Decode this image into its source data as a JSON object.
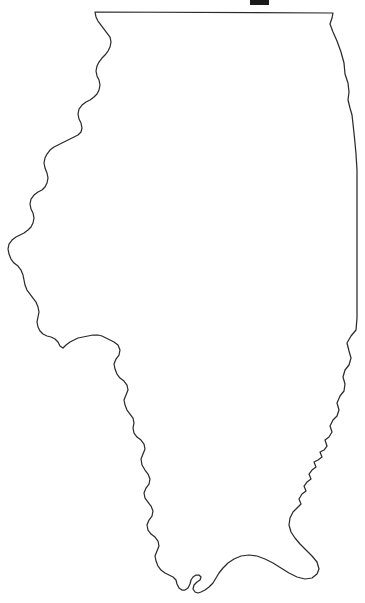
{
  "document": {
    "kind": "outline-map",
    "subject": "Illinois",
    "background_color": "#ffffff",
    "outline_color": "#2b2b2b",
    "fill_color": "#ffffff",
    "stroke_width": 1.25,
    "width": 365,
    "height": 603,
    "text_labels": [],
    "legend": null,
    "title_text": ""
  },
  "artifacts": {
    "top_scan_mark": {
      "name": "scan-artifact",
      "color": "#1a1a1a",
      "x": 250,
      "y": 0,
      "width": 19,
      "height": 5
    }
  },
  "geometry": {
    "viewbox": "0 0 365 603",
    "state_outline_path": "M 95 12 L 333 13 L 332 18 L 330 24 L 333 32 L 337 41 L 341 52 L 344 63 L 345 74 L 348 83 L 349 92 L 348 100 L 350 108 L 352 115 L 353 124 L 354 133 L 355 143 L 356 154 L 357 170 L 357 200 L 357 240 L 357 280 L 357 318 L 356 330 L 351 336 L 347 343 L 349 351 L 351 358 L 349 365 L 345 370 L 343 377 L 345 384 L 344 391 L 340 396 L 337 403 L 339 410 L 337 416 L 333 420 L 330 426 L 332 432 L 329 437 L 325 440 L 327 446 L 324 450 L 320 452 L 322 457 L 318 460 L 314 462 L 316 467 L 312 470 L 309 474 L 311 479 L 307 482 L 304 486 L 306 491 L 302 494 L 299 499 L 301 504 L 297 508 L 293 512 L 290 518 L 289 525 L 291 532 L 295 538 L 300 544 L 306 550 L 312 556 L 317 562 L 319 569 L 317 574 L 312 578 L 305 579 L 297 577 L 289 573 L 281 568 L 273 563 L 265 559 L 257 556 L 249 555 L 241 556 L 234 559 L 228 563 L 223 568 L 219 573 L 216 578 L 213 583 L 209 587 L 205 590 L 201 592 L 198 593 L 195 592 L 193 589 L 194 585 L 197 582 L 200 580 L 201 577 L 199 575 L 196 575 L 193 577 L 191 580 L 190 584 L 188 588 L 185 590 L 182 590 L 179 588 L 177 584 L 176 580 L 173 577 L 169 575 L 165 573 L 161 570 L 158 566 L 156 561 L 155 556 L 157 551 L 159 546 L 158 541 L 155 537 L 151 534 L 148 530 L 147 525 L 149 520 L 152 516 L 153 511 L 151 506 L 148 502 L 145 498 L 144 493 L 146 488 L 149 484 L 150 479 L 148 474 L 145 470 L 142 465 L 141 459 L 143 454 L 145 449 L 144 444 L 141 440 L 137 437 L 134 433 L 133 428 L 134 423 L 133 418 L 130 414 L 127 410 L 125 405 L 124 400 L 126 395 L 128 390 L 127 385 L 124 381 L 120 378 L 117 374 L 115 369 L 114 364 L 116 359 L 119 355 L 120 350 L 118 345 L 114 342 L 110 340 L 106 338 L 102 336 L 98 335 L 93 335 L 88 336 L 83 337 L 78 338 L 74 340 L 70 342 L 66 345 L 63 348 L 60 346 L 58 342 L 55 339 L 51 337 L 47 336 L 43 334 L 40 331 L 38 327 L 37 322 L 38 317 L 39 312 L 38 307 L 36 302 L 33 298 L 30 294 L 27 290 L 25 285 L 24 280 L 23 275 L 21 270 L 18 266 L 14 263 L 11 259 L 9 254 L 8 249 L 9 244 L 12 240 L 16 237 L 20 235 L 24 233 L 28 230 L 31 227 L 33 223 L 34 218 L 33 213 L 31 209 L 30 204 L 31 199 L 34 195 L 38 192 L 42 190 L 45 187 L 47 183 L 48 178 L 47 173 L 45 168 L 44 163 L 45 158 L 47 154 L 50 150 L 54 147 L 58 145 L 62 143 L 66 141 L 70 139 L 74 137 L 78 135 L 81 132 L 82 128 L 81 123 L 79 119 L 78 114 L 79 109 L 82 105 L 86 102 L 90 100 L 94 97 L 97 94 L 99 90 L 100 85 L 99 80 L 97 76 L 96 71 L 97 66 L 99 62 L 102 58 L 105 55 L 108 51 L 110 47 L 111 42 L 110 37 L 107 33 L 104 29 L 101 25 L 98 21 L 96 17 Z",
    "anchor_points": {
      "northwest_corner": [
        95,
        12
      ],
      "northeast_corner": [
        333,
        13
      ],
      "westernmost": [
        8,
        249
      ],
      "easternmost": [
        357,
        200
      ],
      "southern_tip": [
        198,
        593
      ]
    }
  }
}
